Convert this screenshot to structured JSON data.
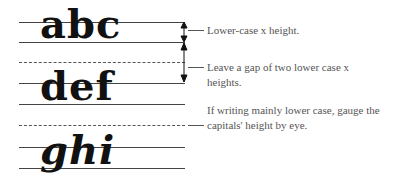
{
  "diagram": {
    "rows": [
      {
        "letters": "abc"
      },
      {
        "letters": "def"
      },
      {
        "letters": "ghi"
      }
    ],
    "annotations": [
      {
        "text": "Lower-case x height."
      },
      {
        "text": "Leave a gap of two lower case x heights."
      },
      {
        "text": "If writing mainly lower case, gauge the capitals' height by eye."
      }
    ],
    "colors": {
      "ink": "#111111",
      "rule": "#444444",
      "note": "#555555"
    }
  }
}
